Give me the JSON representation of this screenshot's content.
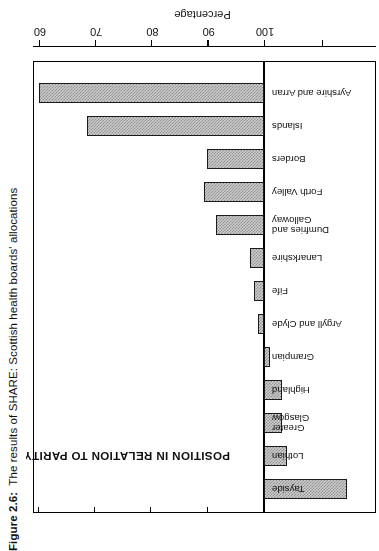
{
  "caption": {
    "label": "Figure 2.6:",
    "text": "The results of SHARE: Scottish health boards' allocations"
  },
  "chart_data": {
    "type": "bar",
    "orientation": "horizontal",
    "title": "",
    "annotation": "POSITION IN RELATION TO PARITY DISTRIBUTION",
    "xlabel": "Percentage",
    "ylabel": "",
    "baseline": 100,
    "xlim": [
      118,
      58
    ],
    "axis_direction": "descending",
    "ticks": [
      100,
      90,
      80,
      70,
      60
    ],
    "tick_labels": [
      "100",
      "90",
      "80",
      "70",
      "60"
    ],
    "grid": false,
    "legend": null,
    "categories": [
      "Tayside",
      "Lothian",
      "Greater Glasgow",
      "Highland",
      "Grampian",
      "Argyll and Clyde",
      "Fife",
      "Lanarkshire",
      "Dumfries and Galloway",
      "Forth Valley",
      "Borders",
      "Islands",
      "Ayrshire and Arran"
    ],
    "values": [
      114.7,
      104.1,
      103.2,
      103.2,
      101.1,
      99.0,
      98.2,
      97.6,
      91.4,
      89.3,
      89.9,
      68.6,
      60.0
    ],
    "bars": [
      {
        "label": "Tayside",
        "value": 114.7,
        "label_lines": [
          "Tayside"
        ]
      },
      {
        "label": "Lothian",
        "value": 104.1,
        "label_lines": [
          "Lothian"
        ]
      },
      {
        "label": "Greater Glasgow",
        "value": 103.2,
        "label_lines": [
          "Greater",
          "Glasgow"
        ]
      },
      {
        "label": "Highland",
        "value": 103.2,
        "label_lines": [
          "Highland"
        ]
      },
      {
        "label": "Grampian",
        "value": 101.1,
        "label_lines": [
          "Grampian"
        ]
      },
      {
        "label": "Argyll and Clyde",
        "value": 99.0,
        "label_lines": [
          "Argyll and Clyde"
        ]
      },
      {
        "label": "Fife",
        "value": 98.2,
        "label_lines": [
          "Fife"
        ]
      },
      {
        "label": "Lanarkshire",
        "value": 97.6,
        "label_lines": [
          "Lanarkshire"
        ]
      },
      {
        "label": "Dumfries and Galloway",
        "value": 91.4,
        "label_lines": [
          "Dumfries and",
          "Galloway"
        ]
      },
      {
        "label": "Forth Valley",
        "value": 89.3,
        "label_lines": [
          "Forth Valley"
        ]
      },
      {
        "label": "Borders",
        "value": 89.9,
        "label_lines": [
          "Borders"
        ]
      },
      {
        "label": "Islands",
        "value": 68.6,
        "label_lines": [
          "Islands"
        ]
      },
      {
        "label": "Ayrshire and Arran",
        "value": 60.0,
        "label_lines": [
          "Ayrshire and Arran"
        ]
      }
    ]
  },
  "colors": {
    "bar_fill": "#cfcfcf",
    "bar_hatch": "#8d8d8d",
    "bar_stroke": "#1a1a1a",
    "axis": "#000000",
    "text": "#111111",
    "background": "#ffffff"
  }
}
